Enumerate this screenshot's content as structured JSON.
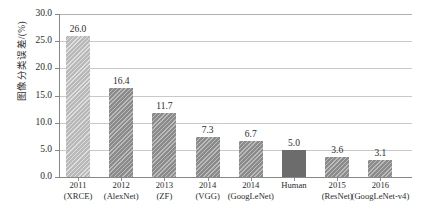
{
  "chart_data": {
    "type": "bar",
    "title": "",
    "subtitle": "",
    "xlabel": "",
    "ylabel": "图像分类误差/(%)",
    "ylim": [
      0,
      30
    ],
    "ytick_labels": [
      "0.0",
      "5.0",
      "10.0",
      "15.0",
      "20.0",
      "25.0",
      "30.0"
    ],
    "ytick_values": [
      0,
      5,
      10,
      15,
      20,
      25,
      30
    ],
    "grid": "horizontal",
    "legend": "none",
    "categories": [
      "2011 (XRCE)",
      "2012 (AlexNet)",
      "2013 (ZF)",
      "2014 (VGG)",
      "2014 (GoogLeNet)",
      "Human",
      "2015 (ResNet)",
      "2016 (GoogLeNet-v4)"
    ],
    "values": [
      26.0,
      16.4,
      11.7,
      7.3,
      6.7,
      5.0,
      3.6,
      3.1
    ],
    "value_labels": [
      "26.0",
      "16.4",
      "11.7",
      "7.3",
      "6.7",
      "5.0",
      "3.6",
      "3.1"
    ],
    "bars": [
      {
        "line1": "2011",
        "line2": "(XRCE)",
        "value": 26.0,
        "label": "26.0",
        "style": "hatch-light",
        "color": "#b9b9b9"
      },
      {
        "line1": "2012",
        "line2": "(AlexNet)",
        "value": 16.4,
        "label": "16.4",
        "style": "hatch-dark",
        "color": "#8b8b8b"
      },
      {
        "line1": "2013",
        "line2": "(ZF)",
        "value": 11.7,
        "label": "11.7",
        "style": "hatch-dark",
        "color": "#8b8b8b"
      },
      {
        "line1": "2014",
        "line2": "(VGG)",
        "value": 7.3,
        "label": "7.3",
        "style": "hatch-dark",
        "color": "#8b8b8b"
      },
      {
        "line1": "2014",
        "line2": "(GoogLeNet)",
        "value": 6.7,
        "label": "6.7",
        "style": "hatch-dark",
        "color": "#8b8b8b"
      },
      {
        "line1": "Human",
        "line2": "",
        "value": 5.0,
        "label": "5.0",
        "style": "solid-dark",
        "color": "#6c6c6c"
      },
      {
        "line1": "2015",
        "line2": "(ResNet)",
        "value": 3.6,
        "label": "3.6",
        "style": "hatch-dark",
        "color": "#8b8b8b"
      },
      {
        "line1": "2016",
        "line2": "(GoogLeNet-v4)",
        "value": 3.1,
        "label": "3.1",
        "style": "hatch-dark",
        "color": "#8b8b8b"
      }
    ]
  },
  "colors": {
    "background": "#ffffff",
    "axis": "#878787",
    "gridline": "#c9c9c9",
    "text": "#2b2b2b",
    "bar_light": "#b9b9b9",
    "bar_medium": "#8b8b8b",
    "bar_dark": "#6c6c6c"
  }
}
